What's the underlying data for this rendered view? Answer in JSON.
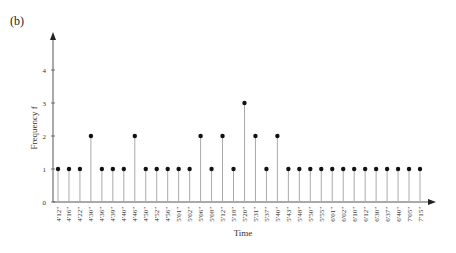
{
  "panel_label": "(b)",
  "chart_data": {
    "type": "stem",
    "title": "",
    "xlabel": "Time",
    "ylabel": "Frequency f",
    "ylim": [
      0,
      4
    ],
    "yticks": [
      0,
      1,
      2,
      3,
      4
    ],
    "grid": false,
    "legend": null,
    "categories": [
      "4'12\"",
      "4'16\"",
      "4'22\"",
      "4'30\"",
      "4'36\"",
      "4'39\"",
      "4'40\"",
      "4'46\"",
      "4'50\"",
      "4'52\"",
      "4'56\"",
      "5'01\"",
      "5'02\"",
      "5'06\"",
      "5'08\"",
      "5'12\"",
      "5'18\"",
      "5'20\"",
      "5'31\"",
      "5'37\"",
      "5'40\"",
      "5'43\"",
      "5'48\"",
      "5'50\"",
      "5'55\"",
      "6'01\"",
      "6'02\"",
      "6'10\"",
      "6'12\"",
      "6'30\"",
      "6'37\"",
      "6'40\"",
      "7'05\"",
      "7'15\""
    ],
    "values": [
      1,
      1,
      1,
      2,
      1,
      1,
      1,
      2,
      1,
      1,
      1,
      1,
      1,
      2,
      1,
      2,
      1,
      3,
      2,
      1,
      2,
      1,
      1,
      1,
      1,
      1,
      1,
      1,
      1,
      1,
      1,
      1,
      1,
      1
    ]
  }
}
